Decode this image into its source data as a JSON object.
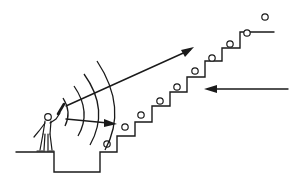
{
  "diagram": {
    "colors": {
      "stroke": "#1a1a1a",
      "background": "#ffffff"
    },
    "elements": {
      "figure": "person-holding-emitter",
      "sound_waves": {
        "count": 4
      },
      "staircase": {
        "steps": 9
      },
      "circles": {
        "count": 10
      },
      "arrows": [
        {
          "name": "long-diagonal-arrow",
          "direction": "up-right"
        },
        {
          "name": "short-horizontal-arrow",
          "direction": "right"
        },
        {
          "name": "incoming-arrow",
          "direction": "left"
        }
      ]
    }
  }
}
